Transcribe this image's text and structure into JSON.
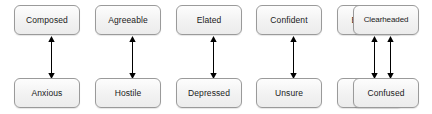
{
  "diagram": {
    "type": "bipolar-mood-scale",
    "title": "",
    "background_color": "#ffffff",
    "node_fill_color": "#f1f1f1",
    "node_border_color": "#9a9a9a",
    "text_color": "#1a1a1a",
    "arrow_color": "#000000",
    "columns": [
      {
        "id": "column-1",
        "positive": "Composed",
        "negative": "Anxious",
        "connector": "double-headed-vertical-arrow"
      },
      {
        "id": "column-2",
        "positive": "Agreeable",
        "negative": "Hostile",
        "connector": "double-headed-vertical-arrow"
      },
      {
        "id": "column-3",
        "positive": "Elated",
        "negative": "Depressed",
        "connector": "double-headed-vertical-arrow"
      },
      {
        "id": "column-4",
        "positive": "Confident",
        "negative": "Unsure",
        "connector": "double-headed-vertical-arrow"
      },
      {
        "id": "column-5",
        "positive": "Energetic",
        "negative": "Tired",
        "connector": "double-headed-vertical-arrow"
      },
      {
        "id": "column-6",
        "positive": "Clearheaded",
        "negative": "Confused",
        "connector": "double-headed-vertical-arrow"
      }
    ]
  }
}
